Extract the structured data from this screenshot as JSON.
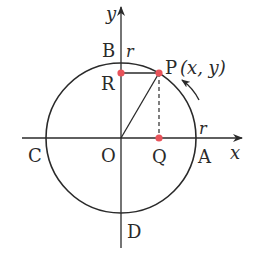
{
  "diagram": {
    "colors": {
      "stroke": "#2a2a2a",
      "point": "#e8535a",
      "background": "#ffffff"
    },
    "axes": {
      "x_label": "x",
      "y_label": "y"
    },
    "points": {
      "origin": "O",
      "A": "A",
      "B": "B",
      "C": "C",
      "D": "D",
      "P": "P",
      "P_coords": "(x, y)",
      "Q": "Q",
      "R": "R"
    },
    "radius_labels": {
      "on_y": "r",
      "on_x": "r"
    },
    "arrow": "counterclockwise-direction"
  }
}
